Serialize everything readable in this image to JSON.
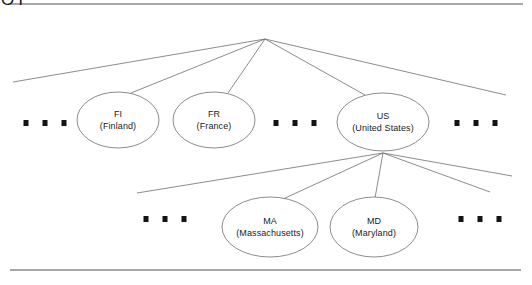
{
  "figure": {
    "type": "tree-diagram",
    "title_node": "ROOT",
    "background_color": "#ffffff",
    "line_color": "#6e6e6e",
    "rule_color": "#8a8a8a",
    "text_color": "#1b1b1b"
  },
  "rules": [
    {
      "name": "top-rule",
      "x1": 8,
      "y1": 4,
      "x2": 523,
      "y2": 4
    },
    {
      "name": "bottom-rule",
      "x1": 10,
      "y1": 270,
      "x2": 521,
      "y2": 270
    }
  ],
  "root": {
    "label": "ROOT",
    "label_x": 265,
    "label_y": 20,
    "fan_x": 265,
    "fan_y": 39
  },
  "nodes": [
    {
      "id": "fi",
      "code": "FI",
      "full": "(Finland)",
      "cx": 118,
      "cy": 120,
      "rx": 41,
      "ry": 28
    },
    {
      "id": "fr",
      "code": "FR",
      "full": "(France)",
      "cx": 214,
      "cy": 120,
      "rx": 41,
      "ry": 28
    },
    {
      "id": "us",
      "code": "US",
      "full": "(United States)",
      "cx": 383,
      "cy": 122,
      "rx": 46,
      "ry": 29
    },
    {
      "id": "ma",
      "code": "MA",
      "full": "(Massachusetts)",
      "cx": 270,
      "cy": 227,
      "rx": 48,
      "ry": 30
    },
    {
      "id": "md",
      "code": "MD",
      "full": "(Maryland)",
      "cx": 374,
      "cy": 227,
      "rx": 44,
      "ry": 30
    }
  ],
  "root_edges": [
    {
      "name": "root-edge-far-left",
      "x1": 265,
      "y1": 39,
      "x2": 13,
      "y2": 82
    },
    {
      "name": "root-edge-to-fi",
      "x1": 265,
      "y1": 39,
      "x2": 131,
      "y2": 93
    },
    {
      "name": "root-edge-to-fr",
      "x1": 265,
      "y1": 39,
      "x2": 228,
      "y2": 93
    },
    {
      "name": "root-edge-to-us",
      "x1": 265,
      "y1": 39,
      "x2": 365,
      "y2": 95
    },
    {
      "name": "root-edge-far-right",
      "x1": 265,
      "y1": 39,
      "x2": 506,
      "y2": 95
    }
  ],
  "us_edges": [
    {
      "name": "us-edge-far-left",
      "x1": 383,
      "y1": 153,
      "x2": 137,
      "y2": 193
    },
    {
      "name": "us-edge-to-ma",
      "x1": 383,
      "y1": 153,
      "x2": 283,
      "y2": 199
    },
    {
      "name": "us-edge-to-md",
      "x1": 383,
      "y1": 153,
      "x2": 375,
      "y2": 198
    },
    {
      "name": "us-edge-right-upper",
      "x1": 383,
      "y1": 153,
      "x2": 512,
      "y2": 176
    },
    {
      "name": "us-edge-far-right",
      "x1": 383,
      "y1": 153,
      "x2": 490,
      "y2": 192
    }
  ],
  "ellipsis_groups": [
    {
      "name": "ellipsis-level1-left",
      "cx": 45,
      "cy": 123,
      "count": 3
    },
    {
      "name": "ellipsis-level1-middle",
      "cx": 295,
      "cy": 123,
      "count": 3
    },
    {
      "name": "ellipsis-level1-right",
      "cx": 476,
      "cy": 123,
      "count": 3
    },
    {
      "name": "ellipsis-level2-left",
      "cx": 165,
      "cy": 219,
      "count": 3
    },
    {
      "name": "ellipsis-level2-right",
      "cx": 480,
      "cy": 219,
      "count": 3
    }
  ]
}
